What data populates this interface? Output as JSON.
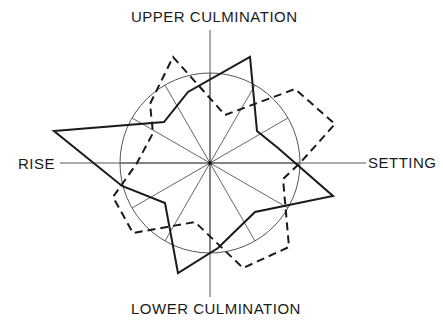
{
  "diagram": {
    "type": "polar-star-diagram",
    "labels": {
      "upper": "UPPER CULMINATION",
      "lower": "LOWER CULMINATION",
      "rise": "RISE",
      "setting": "SETTING"
    },
    "center": [
      210,
      163
    ],
    "reference_circle_radius": 90,
    "spokes_count": 12,
    "spoke_angle_step_deg": 30,
    "axes": {
      "vertical": {
        "from": [
          210,
          30
        ],
        "to": [
          210,
          297
        ]
      },
      "horizontal": {
        "from": [
          60,
          163
        ],
        "to": [
          366,
          163
        ]
      }
    },
    "series": [
      {
        "name": "solid-curve",
        "style": "solid",
        "points": [
          [
            54,
            131
          ],
          [
            164,
            122
          ],
          [
            188,
            92
          ],
          [
            250,
            57
          ],
          [
            257,
            131
          ],
          [
            278,
            148
          ],
          [
            333,
            196
          ],
          [
            255,
            212
          ],
          [
            218,
            248
          ],
          [
            178,
            273
          ],
          [
            165,
            203
          ],
          [
            122,
            186
          ]
        ]
      },
      {
        "name": "dashed-curve",
        "style": "dashed",
        "points": [
          [
            173,
            57
          ],
          [
            225,
            115
          ],
          [
            295,
            89
          ],
          [
            335,
            124
          ],
          [
            300,
            163
          ],
          [
            283,
            179
          ],
          [
            289,
            247
          ],
          [
            243,
            268
          ],
          [
            195,
            222
          ],
          [
            133,
            233
          ],
          [
            113,
            197
          ],
          [
            137,
            163
          ],
          [
            153,
            133
          ],
          [
            150,
            104
          ]
        ]
      }
    ],
    "colors": {
      "line": "#1a1a1a",
      "grid": "#555555",
      "background": "#ffffff"
    }
  }
}
